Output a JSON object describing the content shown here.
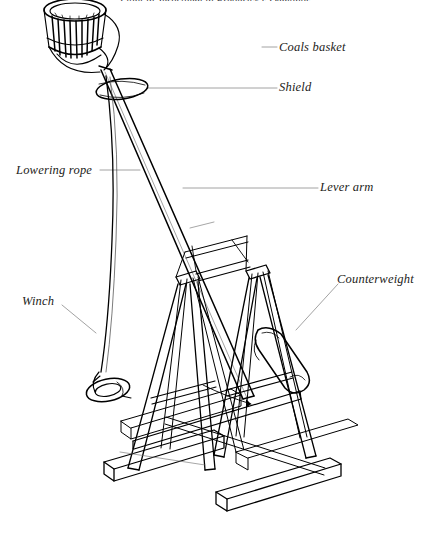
{
  "figure": {
    "title": "Light in Jerusalem in Frederick's Demands",
    "background_color": "#ffffff",
    "ink_color": "#000000",
    "leader_color": "#8a8a8a",
    "labels": [
      {
        "id": "coals-basket",
        "text": "Coals basket"
      },
      {
        "id": "shield",
        "text": "Shield"
      },
      {
        "id": "lowering-rope",
        "text": "Lowering rope"
      },
      {
        "id": "lever-arm",
        "text": "Lever arm"
      },
      {
        "id": "counterweight",
        "text": "Counterweight"
      },
      {
        "id": "winch",
        "text": "Winch"
      }
    ]
  }
}
